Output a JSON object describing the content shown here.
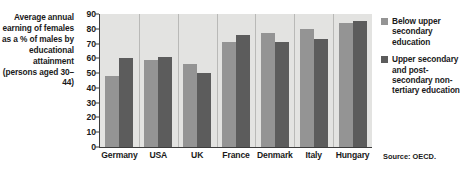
{
  "caption": "Average annual earning of females as a % of males by educational attainment (persons aged 30–44)",
  "source": "Source: OECD.",
  "colors": {
    "below_upper_secondary": "#949494",
    "upper_secondary": "#5c5c5c",
    "plot_background": "#e3e3e1",
    "axis": "#3c3c3c",
    "text": "#1a1a1a"
  },
  "legend": {
    "items": [
      {
        "label": "Below upper secondary education",
        "color": "#949494"
      },
      {
        "label": "Upper secondary and post-secondary non-tertiary education",
        "color": "#5c5c5c"
      }
    ]
  },
  "chart_data": {
    "type": "bar",
    "title": "Average annual earning of females as a % of males by educational attainment (persons aged 30–44)",
    "xlabel": "",
    "ylabel": "",
    "ylim": [
      0,
      90
    ],
    "yticks": [
      0,
      10,
      20,
      30,
      40,
      50,
      60,
      70,
      80,
      90
    ],
    "grid": false,
    "legend_position": "right",
    "categories": [
      "Germany",
      "USA",
      "UK",
      "France",
      "Denmark",
      "Italy",
      "Hungary"
    ],
    "series": [
      {
        "name": "Below upper secondary education",
        "color": "#949494",
        "values": [
          48,
          59,
          56,
          71,
          77,
          80,
          84
        ]
      },
      {
        "name": "Upper secondary and post-secondary non-tertiary education",
        "color": "#5c5c5c",
        "values": [
          60,
          61,
          50,
          76,
          71,
          73,
          85
        ]
      }
    ],
    "annotations": [
      "Source: OECD."
    ]
  }
}
